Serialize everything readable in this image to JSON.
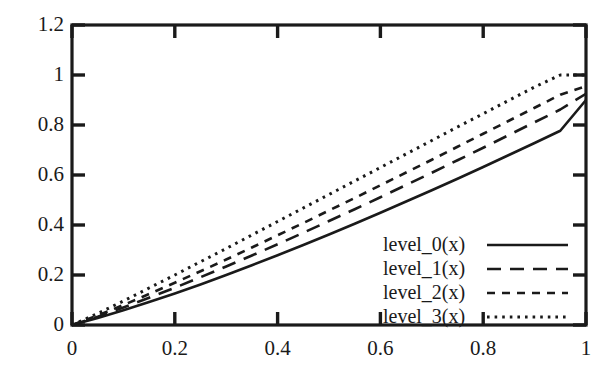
{
  "chart_data": {
    "type": "line",
    "title": "",
    "xlabel": "",
    "ylabel": "",
    "xlim": [
      0,
      1
    ],
    "ylim": [
      0,
      1.2
    ],
    "xticks": [
      "0",
      "0.2",
      "0.4",
      "0.6",
      "0.8",
      "1"
    ],
    "xtick_values": [
      0,
      0.2,
      0.4,
      0.6,
      0.8,
      1
    ],
    "yticks": [
      "0",
      "0.2",
      "0.4",
      "0.6",
      "0.8",
      "1",
      "1.2"
    ],
    "ytick_values": [
      0,
      0.2,
      0.4,
      0.6,
      0.8,
      1,
      1.2
    ],
    "grid": false,
    "legend_position": "center-right",
    "frame": "box",
    "x": [
      0,
      0.05,
      0.1,
      0.15,
      0.2,
      0.25,
      0.3,
      0.35,
      0.4,
      0.45,
      0.5,
      0.55,
      0.6,
      0.65,
      0.7,
      0.75,
      0.8,
      0.85,
      0.9,
      0.95,
      1
    ],
    "series": [
      {
        "name": "level_0(x)",
        "style": "solid",
        "color": "#1a1a1a",
        "values": [
          0,
          0.028,
          0.059,
          0.092,
          0.126,
          0.162,
          0.2,
          0.239,
          0.279,
          0.32,
          0.362,
          0.405,
          0.449,
          0.494,
          0.539,
          0.585,
          0.632,
          0.68,
          0.728,
          0.777,
          0.9
        ]
      },
      {
        "name": "level_1(x)",
        "style": "long-dash",
        "color": "#1a1a1a",
        "values": [
          0,
          0.033,
          0.07,
          0.109,
          0.149,
          0.191,
          0.234,
          0.278,
          0.323,
          0.369,
          0.416,
          0.463,
          0.511,
          0.56,
          0.609,
          0.659,
          0.709,
          0.76,
          0.811,
          0.862,
          0.925
        ]
      },
      {
        "name": "level_2(x)",
        "style": "short-dash",
        "color": "#1a1a1a",
        "values": [
          0,
          0.038,
          0.08,
          0.124,
          0.169,
          0.215,
          0.262,
          0.31,
          0.359,
          0.408,
          0.458,
          0.508,
          0.559,
          0.61,
          0.661,
          0.713,
          0.765,
          0.817,
          0.869,
          0.921,
          0.955
        ]
      },
      {
        "name": "level_3(x)",
        "style": "dotted",
        "color": "#1a1a1a",
        "values": [
          0,
          0.046,
          0.096,
          0.148,
          0.2,
          0.253,
          0.306,
          0.36,
          0.414,
          0.468,
          0.522,
          0.576,
          0.63,
          0.684,
          0.738,
          0.792,
          0.845,
          0.899,
          0.952,
          1.0,
          1.0
        ]
      }
    ]
  },
  "legend": {
    "entries": [
      {
        "label": "level_0(x)",
        "style": "solid"
      },
      {
        "label": "level_1(x)",
        "style": "long-dash"
      },
      {
        "label": "level_2(x)",
        "style": "short-dash"
      },
      {
        "label": "level_3(x)",
        "style": "dotted"
      }
    ]
  },
  "axes": {
    "x": {
      "ticks": [
        {
          "label": "0",
          "value": 0
        },
        {
          "label": "0.2",
          "value": 0.2
        },
        {
          "label": "0.4",
          "value": 0.4
        },
        {
          "label": "0.6",
          "value": 0.6
        },
        {
          "label": "0.8",
          "value": 0.8
        },
        {
          "label": "1",
          "value": 1
        }
      ]
    },
    "y": {
      "ticks": [
        {
          "label": "0",
          "value": 0
        },
        {
          "label": "0.2",
          "value": 0.2
        },
        {
          "label": "0.4",
          "value": 0.4
        },
        {
          "label": "0.6",
          "value": 0.6
        },
        {
          "label": "0.8",
          "value": 0.8
        },
        {
          "label": "1",
          "value": 1
        },
        {
          "label": "1.2",
          "value": 1.2
        }
      ]
    }
  },
  "colors": {
    "axis": "#1a1a1a",
    "line": "#1a1a1a",
    "background": "#ffffff"
  }
}
